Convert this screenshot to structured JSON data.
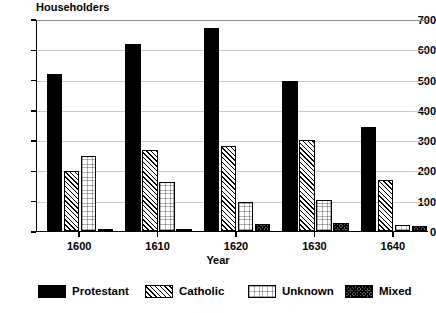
{
  "chart_data": {
    "type": "bar",
    "title": "",
    "ylabel": "Householders",
    "xlabel": "Year",
    "categories": [
      "1600",
      "1610",
      "1620",
      "1630",
      "1640"
    ],
    "series": [
      {
        "name": "Protestant",
        "pattern": "solid-black",
        "values": [
          520,
          618,
          670,
          495,
          345
        ]
      },
      {
        "name": "Catholic",
        "pattern": "diagonal-hatch",
        "values": [
          198,
          267,
          280,
          300,
          170
        ]
      },
      {
        "name": "Unknown",
        "pattern": "light-stipple",
        "values": [
          248,
          162,
          97,
          103,
          21
        ]
      },
      {
        "name": "Mixed",
        "pattern": "dense-crosshatch",
        "values": [
          5,
          8,
          22,
          25,
          16
        ]
      }
    ],
    "ylim": [
      0,
      700
    ],
    "yticks": [
      0,
      100,
      200,
      300,
      400,
      500,
      600,
      700
    ],
    "ytick_labels": [
      "0",
      "100",
      "200",
      "300",
      "400",
      "500",
      "600",
      "700"
    ],
    "grid": true,
    "grid_axis": "y",
    "legend_position": "bottom",
    "colors": {
      "protestant": "#000000",
      "catholic": "#ffffff",
      "unknown": "#ffffff",
      "mixed": "#5a5a5a",
      "axis": "#000000",
      "gridline": "#c9c9c9",
      "background": "#ffffff"
    }
  }
}
